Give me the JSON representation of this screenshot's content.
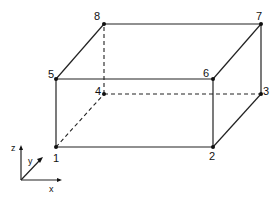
{
  "diagram": {
    "type": "wireframe-box",
    "nodes": [
      {
        "id": "1",
        "label": "1",
        "x": 56,
        "y": 147
      },
      {
        "id": "2",
        "label": "2",
        "x": 213,
        "y": 147
      },
      {
        "id": "3",
        "label": "3",
        "x": 261,
        "y": 94
      },
      {
        "id": "4",
        "label": "4",
        "x": 104,
        "y": 94
      },
      {
        "id": "5",
        "label": "5",
        "x": 56,
        "y": 79
      },
      {
        "id": "6",
        "label": "6",
        "x": 213,
        "y": 79
      },
      {
        "id": "7",
        "label": "7",
        "x": 261,
        "y": 24
      },
      {
        "id": "8",
        "label": "8",
        "x": 104,
        "y": 24
      }
    ],
    "edges_solid": [
      [
        "1",
        "2"
      ],
      [
        "2",
        "6"
      ],
      [
        "6",
        "5"
      ],
      [
        "5",
        "1"
      ],
      [
        "5",
        "8"
      ],
      [
        "8",
        "7"
      ],
      [
        "7",
        "6"
      ],
      [
        "7",
        "3"
      ],
      [
        "3",
        "2"
      ]
    ],
    "edges_hidden": [
      [
        "1",
        "4"
      ],
      [
        "4",
        "3"
      ],
      [
        "4",
        "8"
      ]
    ],
    "axes": {
      "z_label": "z",
      "y_label": "y",
      "x_label": "x"
    }
  }
}
